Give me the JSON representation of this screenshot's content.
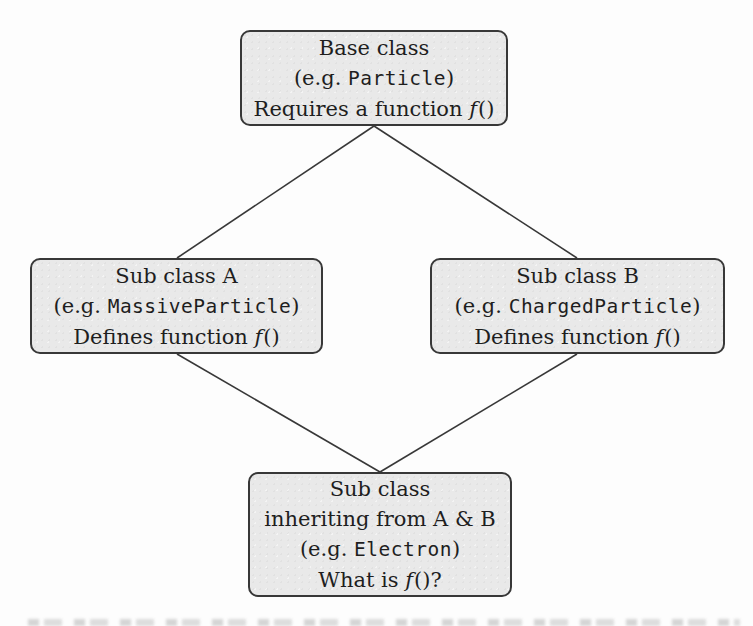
{
  "diagram": {
    "colors": {
      "box_fill": "#e9e9e9",
      "box_border": "#383838",
      "edge_line": "#383838",
      "text": "#1e1e1e",
      "background": "#fdfdfd"
    },
    "nodes": {
      "base": {
        "title": "Base class",
        "example_prefix": "(e.g. ",
        "example_code": "Particle",
        "example_suffix": ")",
        "note_prefix": "Requires a function ",
        "note_math": "f",
        "note_suffix": "()"
      },
      "sub_a": {
        "title": "Sub class A",
        "example_prefix": "(e.g. ",
        "example_code": "MassiveParticle",
        "example_suffix": ")",
        "note_prefix": "Defines function ",
        "note_math": "f",
        "note_suffix": "()"
      },
      "sub_b": {
        "title": "Sub class B",
        "example_prefix": "(e.g. ",
        "example_code": "ChargedParticle",
        "example_suffix": ")",
        "note_prefix": "Defines function ",
        "note_math": "f",
        "note_suffix": "()"
      },
      "sub_ab": {
        "title": "Sub class",
        "title2": "inheriting from A & B",
        "example_prefix": "(e.g. ",
        "example_code": "Electron",
        "example_suffix": ")",
        "note_prefix": "What is ",
        "note_math": "f",
        "note_suffix": "()?"
      }
    },
    "edges": [
      {
        "from": "base",
        "to": "sub_a"
      },
      {
        "from": "base",
        "to": "sub_b"
      },
      {
        "from": "sub_a",
        "to": "sub_ab"
      },
      {
        "from": "sub_b",
        "to": "sub_ab"
      }
    ]
  }
}
